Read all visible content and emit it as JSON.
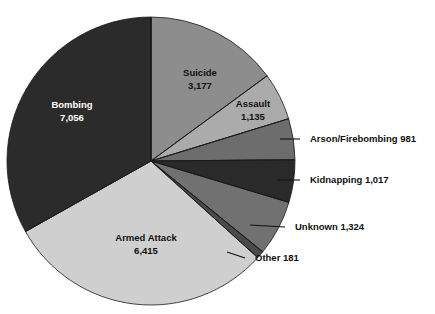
{
  "chart_data": {
    "type": "pie",
    "title": "",
    "subtitle": "",
    "xlabel": "",
    "ylabel": "",
    "legend_position": "none",
    "grid": false,
    "total": 21286,
    "start_angle_deg": 0,
    "direction": "clockwise",
    "categories": [
      "Suicide",
      "Assault",
      "Arson/Firebombing",
      "Kidnapping",
      "Unknown",
      "Other",
      "Armed Attack",
      "Bombing"
    ],
    "values": [
      3177,
      1135,
      981,
      1017,
      1324,
      181,
      6415,
      7056
    ],
    "slices": [
      {
        "name": "Suicide",
        "value": 3177,
        "value_text": "3,177",
        "label_text": "Suicide",
        "label_style": "inside",
        "color": "#8d8d8d",
        "text_color": "#111111"
      },
      {
        "name": "Assault",
        "value": 1135,
        "value_text": "1,135",
        "label_text": "Assault",
        "label_style": "inside",
        "color": "#ababab",
        "text_color": "#111111"
      },
      {
        "name": "Arson/Firebombing",
        "value": 981,
        "value_text": "981",
        "label_text": "Arson/Firebombing 981",
        "label_style": "callout",
        "color": "#6d6d6d",
        "text_color": "#111111"
      },
      {
        "name": "Kidnapping",
        "value": 1017,
        "value_text": "1,017",
        "label_text": "Kidnapping 1,017",
        "label_style": "callout",
        "color": "#2a2a2a",
        "text_color": "#111111"
      },
      {
        "name": "Unknown",
        "value": 1324,
        "value_text": "1,324",
        "label_text": "Unknown 1,324",
        "label_style": "callout",
        "color": "#717171",
        "text_color": "#111111"
      },
      {
        "name": "Other",
        "value": 181,
        "value_text": "181",
        "label_text": "Other 181",
        "label_style": "callout",
        "color": "#4a4a4a",
        "text_color": "#111111"
      },
      {
        "name": "Armed Attack",
        "value": 6415,
        "value_text": "6,415",
        "label_text": "Armed Attack",
        "label_style": "inside",
        "color": "#cfcfcf",
        "text_color": "#111111"
      },
      {
        "name": "Bombing",
        "value": 7056,
        "value_text": "7,056",
        "label_text": "Bombing",
        "label_style": "inside",
        "color": "#2b2b2b",
        "text_color": "#ffffff"
      }
    ],
    "inside_labels": [
      {
        "name": "Suicide",
        "line1": "Suicide",
        "line2": "3,177",
        "x": 200,
        "y": 73,
        "tone": "on-light"
      },
      {
        "name": "Assault",
        "line1": "Assault",
        "line2": "1,135",
        "x": 253,
        "y": 104,
        "tone": "on-light"
      },
      {
        "name": "Armed Attack",
        "line1": "Armed Attack",
        "line2": "6,415",
        "x": 146,
        "y": 238,
        "tone": "on-light"
      },
      {
        "name": "Bombing",
        "line1": "Bombing",
        "line2": "7,056",
        "x": 72,
        "y": 105,
        "tone": "on-dark"
      }
    ],
    "callouts": [
      {
        "name": "Arson/Firebombing",
        "text": "Arson/Firebombing 981",
        "px": 280,
        "py": 139,
        "mx": 300,
        "my": 139,
        "tx": 310,
        "ty": 139
      },
      {
        "name": "Kidnapping",
        "text": "Kidnapping 1,017",
        "px": 277,
        "py": 180,
        "mx": 300,
        "my": 180,
        "tx": 310,
        "ty": 180
      },
      {
        "name": "Unknown",
        "text": "Unknown 1,324",
        "px": 250,
        "py": 225,
        "mx": 285,
        "my": 227,
        "tx": 295,
        "ty": 227
      },
      {
        "name": "Other",
        "text": "Other 181",
        "px": 227,
        "py": 252,
        "mx": 245,
        "my": 258,
        "tx": 255,
        "ty": 258
      }
    ],
    "geometry": {
      "center_x": 151,
      "center_y": 161,
      "radius": 144
    },
    "colors": {
      "background": "#ffffff",
      "outline": "#1a1a1a",
      "text": "#111111",
      "text_inverse": "#ffffff"
    }
  }
}
